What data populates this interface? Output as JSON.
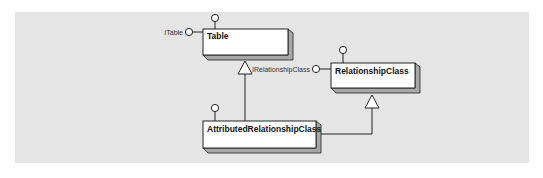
{
  "diagram": {
    "type": "UML class diagram",
    "colors": {
      "panel_background": "#e5e5e5",
      "box_fill": "#ffffff",
      "box_border": "#222222",
      "box_depth": "#a8a8a8",
      "line": "#222222"
    },
    "classes": [
      {
        "id": "table",
        "label": "Table",
        "interfaces": [
          "ITable"
        ]
      },
      {
        "id": "relationship_class",
        "label": "RelationshipClass",
        "interfaces": [
          "IRelationshipClass"
        ]
      },
      {
        "id": "attributed_relationship_class",
        "label": "AttributedRelationshipClass",
        "interfaces": []
      }
    ],
    "interface_labels": {
      "table": "ITable",
      "relationship_class": "IRelationshipClass"
    },
    "inheritance": [
      {
        "from": "AttributedRelationshipClass",
        "to": "Table"
      },
      {
        "from": "AttributedRelationshipClass",
        "to": "RelationshipClass"
      }
    ]
  }
}
